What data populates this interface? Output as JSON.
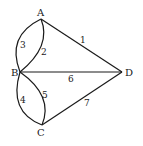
{
  "diagram": {
    "type": "multigraph",
    "nodes": [
      {
        "id": "A",
        "label": "A"
      },
      {
        "id": "B",
        "label": "B"
      },
      {
        "id": "C",
        "label": "C"
      },
      {
        "id": "D",
        "label": "D"
      }
    ],
    "edges": [
      {
        "id": "1",
        "label": "1",
        "from": "A",
        "to": "D"
      },
      {
        "id": "2",
        "label": "2",
        "from": "A",
        "to": "B"
      },
      {
        "id": "3",
        "label": "3",
        "from": "A",
        "to": "B"
      },
      {
        "id": "4",
        "label": "4",
        "from": "B",
        "to": "C"
      },
      {
        "id": "5",
        "label": "5",
        "from": "B",
        "to": "C"
      },
      {
        "id": "6",
        "label": "6",
        "from": "B",
        "to": "D"
      },
      {
        "id": "7",
        "label": "7",
        "from": "C",
        "to": "D"
      }
    ]
  }
}
